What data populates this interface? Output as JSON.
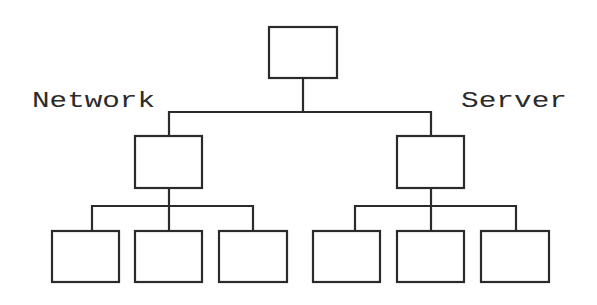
{
  "diagram": {
    "type": "hierarchy-tree",
    "stroke_color": "#2b2b2b",
    "background": "#ffffff",
    "labels": {
      "left": "Network",
      "right": "Server"
    },
    "nodes": {
      "root": {
        "x": 269,
        "y": 27,
        "w": 68,
        "h": 51
      },
      "level1": [
        {
          "id": "network-node",
          "x": 135,
          "y": 136,
          "w": 67,
          "h": 52
        },
        {
          "id": "server-node",
          "x": 397,
          "y": 136,
          "w": 67,
          "h": 52
        }
      ],
      "level2": [
        {
          "parent": "network-node",
          "x": 52,
          "y": 231,
          "w": 67,
          "h": 51
        },
        {
          "parent": "network-node",
          "x": 135,
          "y": 231,
          "w": 67,
          "h": 51
        },
        {
          "parent": "network-node",
          "x": 219,
          "y": 231,
          "w": 68,
          "h": 51
        },
        {
          "parent": "server-node",
          "x": 313,
          "y": 231,
          "w": 67,
          "h": 51
        },
        {
          "parent": "server-node",
          "x": 397,
          "y": 231,
          "w": 67,
          "h": 51
        },
        {
          "parent": "server-node",
          "x": 481,
          "y": 231,
          "w": 68,
          "h": 51
        }
      ]
    }
  }
}
